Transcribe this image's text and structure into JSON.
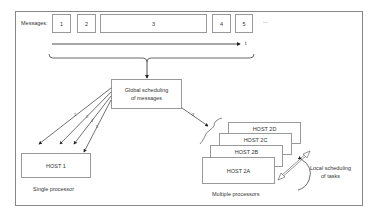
{
  "diagram": {
    "messages_label": "Messages:",
    "messages": [
      "1",
      "2",
      "3",
      "4",
      "5"
    ],
    "ellipsis": "...",
    "time_label": "t",
    "global_scheduler": {
      "line1": "Global scheduling",
      "line2": "of messages"
    },
    "left_arrow_labels": [
      "1",
      "2",
      "4",
      "5"
    ],
    "right_arrow_label": "3",
    "host1": "HOST 1",
    "single_caption": "Single processor",
    "hosts2": [
      "HOST 2D",
      "HOST 2C",
      "HOST 2B",
      "HOST 2A"
    ],
    "multi_caption": "Multiple processors",
    "local_scheduling": {
      "line1": "Local scheduling",
      "line2": "of tasks"
    }
  },
  "colors": {
    "line": "#333333",
    "box_border": "#999999",
    "frame": "#888888"
  }
}
